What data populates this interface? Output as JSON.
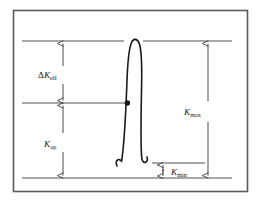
{
  "figure": {
    "background_color": "#ffffff",
    "frame": {
      "name": "outer-border",
      "color": "#5a5a5a",
      "x": 13,
      "y": 10,
      "width": 235,
      "height": 182
    },
    "curve": {
      "name": "load-cycle-loop",
      "color": "#1a1a1a",
      "description": "narrow inverted-U hysteresis loop with outward curled tails"
    },
    "marker": {
      "name": "crack-opening-point",
      "color": "#1a1a1a",
      "x": 128,
      "y": 103
    },
    "reference_lines": [
      {
        "name": "k-max-level-line",
        "y": 41,
        "x1": 22,
        "x2": 232
      },
      {
        "name": "k-op-level-line",
        "y": 103,
        "x1": 22,
        "x2": 130
      },
      {
        "name": "k-min-level-line",
        "y": 163,
        "x1": 152,
        "x2": 205
      },
      {
        "name": "baseline-zero-line",
        "y": 178,
        "x1": 22,
        "x2": 232
      }
    ],
    "dimensions": [
      {
        "name": "delta-k-eff-dimension",
        "symbol": "Δ",
        "base": "K",
        "subscript": "eff",
        "arrow_x": 63,
        "top": 41,
        "bottom": 103,
        "label_x": 40,
        "label_y": 75
      },
      {
        "name": "k-op-dimension",
        "symbol": "",
        "base": "K",
        "subscript": "op",
        "arrow_x": 63,
        "top": 103,
        "bottom": 178,
        "label_x": 44,
        "label_y": 144
      },
      {
        "name": "k-max-dimension",
        "symbol": "",
        "base": "K",
        "subscript": "max",
        "arrow_x": 208,
        "top": 41,
        "bottom": 178,
        "label_x": 185,
        "label_y": 112
      },
      {
        "name": "k-min-dimension",
        "symbol": "",
        "base": "K",
        "subscript": "min",
        "arrow_x": 163,
        "top": 163,
        "bottom": 178,
        "label_x": 172,
        "label_y": 175
      }
    ]
  }
}
